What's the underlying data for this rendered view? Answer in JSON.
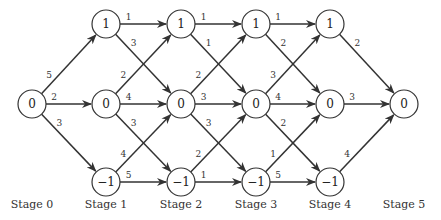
{
  "colors": {
    "stroke": "#333333",
    "node_fill": "#ffffff",
    "text": "#222222"
  },
  "layout": {
    "stage_x": [
      32,
      106,
      181,
      256,
      330,
      404
    ],
    "row_y": {
      "1": 24,
      "0": 104,
      "-1": 182
    },
    "node_radius": 14,
    "label_y": 208
  },
  "stages": [
    {
      "label": "Stage 0",
      "nodes": [
        {
          "id": "s0_0",
          "value": "0",
          "row": "0"
        }
      ]
    },
    {
      "label": "Stage 1",
      "nodes": [
        {
          "id": "s1_1",
          "value": "1",
          "row": "1"
        },
        {
          "id": "s1_0",
          "value": "0",
          "row": "0"
        },
        {
          "id": "s1_m1",
          "value": "−1",
          "row": "-1"
        }
      ]
    },
    {
      "label": "Stage 2",
      "nodes": [
        {
          "id": "s2_1",
          "value": "1",
          "row": "1"
        },
        {
          "id": "s2_0",
          "value": "0",
          "row": "0"
        },
        {
          "id": "s2_m1",
          "value": "−1",
          "row": "-1"
        }
      ]
    },
    {
      "label": "Stage 3",
      "nodes": [
        {
          "id": "s3_1",
          "value": "1",
          "row": "1"
        },
        {
          "id": "s3_0",
          "value": "0",
          "row": "0"
        },
        {
          "id": "s3_m1",
          "value": "−1",
          "row": "-1"
        }
      ]
    },
    {
      "label": "Stage 4",
      "nodes": [
        {
          "id": "s4_1",
          "value": "1",
          "row": "1"
        },
        {
          "id": "s4_0",
          "value": "0",
          "row": "0"
        },
        {
          "id": "s4_m1",
          "value": "−1",
          "row": "-1"
        }
      ]
    },
    {
      "label": "Stage 5",
      "nodes": [
        {
          "id": "s5_0",
          "value": "0",
          "row": "0"
        }
      ]
    }
  ],
  "edges": [
    {
      "from": "s0_0",
      "to": "s1_1",
      "weight": "5"
    },
    {
      "from": "s0_0",
      "to": "s1_0",
      "weight": "2"
    },
    {
      "from": "s0_0",
      "to": "s1_m1",
      "weight": "3"
    },
    {
      "from": "s1_1",
      "to": "s2_1",
      "weight": "1"
    },
    {
      "from": "s1_1",
      "to": "s2_0",
      "weight": "3"
    },
    {
      "from": "s1_0",
      "to": "s2_1",
      "weight": "2"
    },
    {
      "from": "s1_0",
      "to": "s2_0",
      "weight": "4"
    },
    {
      "from": "s1_0",
      "to": "s2_m1",
      "weight": "3"
    },
    {
      "from": "s1_m1",
      "to": "s2_0",
      "weight": "4"
    },
    {
      "from": "s1_m1",
      "to": "s2_m1",
      "weight": "5"
    },
    {
      "from": "s2_1",
      "to": "s3_1",
      "weight": "1"
    },
    {
      "from": "s2_1",
      "to": "s3_0",
      "weight": "1"
    },
    {
      "from": "s2_0",
      "to": "s3_1",
      "weight": "2"
    },
    {
      "from": "s2_0",
      "to": "s3_0",
      "weight": "3"
    },
    {
      "from": "s2_0",
      "to": "s3_m1",
      "weight": "3"
    },
    {
      "from": "s2_m1",
      "to": "s3_0",
      "weight": "2"
    },
    {
      "from": "s2_m1",
      "to": "s3_m1",
      "weight": "1"
    },
    {
      "from": "s3_1",
      "to": "s4_1",
      "weight": "1"
    },
    {
      "from": "s3_1",
      "to": "s4_0",
      "weight": "2"
    },
    {
      "from": "s3_0",
      "to": "s4_1",
      "weight": "3"
    },
    {
      "from": "s3_0",
      "to": "s4_0",
      "weight": "4"
    },
    {
      "from": "s3_0",
      "to": "s4_m1",
      "weight": "2"
    },
    {
      "from": "s3_m1",
      "to": "s4_0",
      "weight": "1"
    },
    {
      "from": "s3_m1",
      "to": "s4_m1",
      "weight": "5"
    },
    {
      "from": "s4_1",
      "to": "s5_0",
      "weight": "2"
    },
    {
      "from": "s4_0",
      "to": "s5_0",
      "weight": "3"
    },
    {
      "from": "s4_m1",
      "to": "s5_0",
      "weight": "4"
    }
  ]
}
